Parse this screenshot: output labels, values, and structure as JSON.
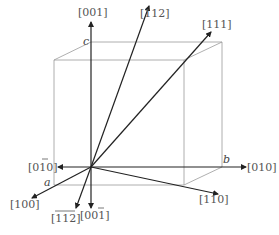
{
  "diagram": {
    "type": "crystal-direction-diagram",
    "origin": {
      "x": 91,
      "y": 167
    },
    "axes": {
      "a": "a",
      "b": "b",
      "c": "c"
    },
    "directions": [
      {
        "id": "001",
        "label": "[001]",
        "overline": [],
        "tip": {
          "x": 91,
          "y": 22
        }
      },
      {
        "id": "112",
        "label": "[112]",
        "overline": [],
        "tip": {
          "x": 149,
          "y": 6
        }
      },
      {
        "id": "111",
        "label": "[111]",
        "overline": [],
        "tip": {
          "x": 211,
          "y": 32
        }
      },
      {
        "id": "010",
        "label": "[010]",
        "overline": [],
        "tip": {
          "x": 246,
          "y": 167
        }
      },
      {
        "id": "110",
        "label": "[110]",
        "overline": [],
        "tip": {
          "x": 218,
          "y": 194
        }
      },
      {
        "id": "0-10",
        "label": "[0̅1̅0]",
        "overline": [
          1
        ],
        "tip": {
          "x": 58,
          "y": 167
        }
      },
      {
        "id": "100",
        "label": "[100]",
        "overline": [],
        "tip": {
          "x": 32,
          "y": 198
        }
      },
      {
        "id": "-1-1-2",
        "label": "[̅1̅1̅2]",
        "overline": [
          0,
          1,
          2
        ],
        "tip": {
          "x": 76,
          "y": 208
        }
      },
      {
        "id": "00-1",
        "label": "[00̅1]",
        "overline": [
          2
        ],
        "tip": {
          "x": 91,
          "y": 208
        }
      }
    ],
    "label_text": {
      "d001": "[001]",
      "d112": "[112]",
      "d111": "[111]",
      "d010": "[010]",
      "d110": "[110]",
      "d0m10_open": "[0",
      "d0m10_bar": "1",
      "d0m10_close": "0]",
      "d100": "[100]",
      "dm1m1m2_open": "[",
      "dm1m1m2_bar": "112",
      "dm1m1m2_close": "]",
      "d00m1_open": "[00",
      "d00m1_bar": "1",
      "d00m1_close": "]"
    }
  }
}
